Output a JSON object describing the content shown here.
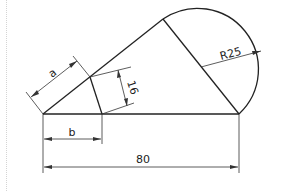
{
  "drawing": {
    "title": "Technical drawing: triangle with tangent semicircle",
    "dimensions": {
      "overall_length": "80",
      "radius": "R25",
      "perpendicular": "16",
      "slant_segment": "a",
      "base_segment": "b"
    },
    "colors": {
      "line": "#222222",
      "background": "#ffffff"
    }
  }
}
